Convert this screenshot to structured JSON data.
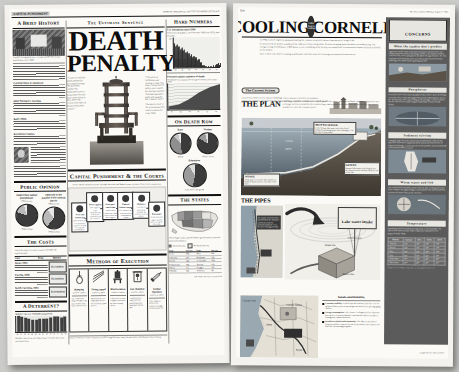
{
  "meta": {
    "background_color": "#cbcbc9",
    "page_color": "#fbfaf7",
    "ink_color": "#111111",
    "accent_dark": "#5b5b5b"
  },
  "left_page": {
    "flag": "CAPITAL PUNISHMENT",
    "dateline": "SUNDAY, JANUARY 20, 1991  THE EXAMINER  SECTION  B",
    "kicker": "The Ultimate Sentence",
    "masthead_line1": "DEATH",
    "masthead_line2": "PENALTY",
    "pull_quote_left": "“I want to stand for death penalty for first-degree murder. We have been conducting experiments over a long, long time and have never failed in fact, deterring victims any rights of prosecuting under statute.”",
    "pull_quote_right": "“The spirit of retribution and revenge is what I do long criminal justice policy, not it stands for proving solutions. The death penalty is politically popular, but it doesn’t work.”",
    "chair_caption": "The electric chair at the state penitentiary, used in executions since 1924.",
    "columns": {
      "left": {
        "section_title": "A Brief History",
        "photo_caption": "A public hanging draws a crowd outside the county courthouse, circa 1885.",
        "subheads": [
          "Colonial times to statehood",
          "After Furman v. Georgia",
          "Early 1980s",
          "Executions resume"
        ]
      },
      "public_opinion": {
        "section_title": "Public Opinion",
        "charts": [
          {
            "title": "Supporting capital punishment",
            "subtitle": "1994 survey",
            "slices": [
              {
                "label": "Favor",
                "value": 80
              },
              {
                "label": "Oppose",
                "value": 16
              },
              {
                "label": "No opinion",
                "value": 4
              }
            ],
            "source": "1994 Gallup"
          },
          {
            "title": "Opposed to the penalty if life without parole",
            "subtitle": "1994 survey",
            "slices": [
              {
                "label": "Favor",
                "value": 61
              },
              {
                "label": "Oppose",
                "value": 29
              },
              {
                "label": "No opinion",
                "value": 10
              }
            ],
            "source": "1994 Gallup"
          }
        ]
      },
      "costs": {
        "section_title": "The Costs",
        "intro": "The price tag of a capital case far exceeds life imprisonment.",
        "table_headers": [
          "Case",
          "Trial",
          "Appeals",
          "Execution"
        ],
        "rows": [
          {
            "label": "Texas, 1992",
            "text": "Average cost of a capital trial and appeals, about triple the cost of life imprisonment.",
            "value": "$2.3 million"
          },
          {
            "label": "Florida, 1988",
            "text": "State costs for each execution, compared with the cost of life in prison.",
            "value": "$3.2 million"
          },
          {
            "label": "North Carolina, 1993",
            "text": "Extra cost per death penalty case over non-capital murder case.",
            "value": "$2.16 million"
          }
        ]
      },
      "deterrent": {
        "section_title": "A Deterrent?",
        "chart": {
          "type": "bar",
          "title": "Murder rate per 100,000 population",
          "categories": [
            "80",
            "81",
            "82",
            "83",
            "84",
            "85",
            "86",
            "87",
            "88",
            "89",
            "90",
            "91",
            "92",
            "93"
          ],
          "values": [
            10.2,
            9.8,
            9.1,
            8.3,
            7.9,
            7.9,
            8.6,
            8.3,
            8.4,
            8.7,
            9.4,
            9.8,
            9.3,
            9.5
          ],
          "ylabel": "Rate",
          "note": "Murder rates have not fallen faster in states that carry out executions."
        }
      }
    },
    "courts": {
      "section_title": "Capital Punishment & the Courts",
      "intro": "How a death sentence moves through the state and federal court systems, from trial to execution.",
      "steps": [
        {
          "n": "1",
          "label": "Trial and sentencing",
          "text": "Jury convicts and recommends a sentence of death in a separate penalty phase."
        },
        {
          "n": "2",
          "label": "Direct appeal",
          "text": "State supreme court automatically reviews the conviction and the sentence."
        },
        {
          "n": "3",
          "label": "State post-conviction",
          "text": "Inmate raises claims that could not be raised on direct appeal."
        },
        {
          "n": "4",
          "label": "Federal habeas corpus",
          "text": "U.S. district court reviews federal constitutional claims."
        },
        {
          "n": "5",
          "label": "Clemency",
          "text": "Governor or board may commute the sentence to life in prison."
        },
        {
          "n": "6",
          "label": "Execution",
          "text": "Death warrant is signed and the date is set by the trial court."
        }
      ]
    },
    "methods": {
      "section_title": "Methods of Execution",
      "items": [
        {
          "name": "Hanging",
          "icon": "noose-icon",
          "states": "Used in 3 states",
          "text": "The condemned drops through a trap door; death results from a broken neck."
        },
        {
          "name": "Firing squad",
          "icon": "rifles-icon",
          "states": "Used in 2 states",
          "text": "Marksmen fire at a target pinned over the heart from about 20 feet."
        },
        {
          "name": "Electrocution",
          "icon": "electric-chair-icon",
          "states": "Used in 11 states",
          "text": "A jolt of 2,000 volts is applied, followed by lower-voltage cycles."
        },
        {
          "name": "Gas chamber",
          "icon": "gas-chamber-icon",
          "states": "Used in 5 states",
          "text": "Cyanide pellets drop into acid, producing lethal hydrogen cyanide gas."
        },
        {
          "name": "Lethal injection",
          "icon": "syringe-icon",
          "states": "Used in 27 states",
          "text": "Three drugs are delivered in sequence through an intravenous line."
        }
      ]
    },
    "right_column": {
      "hard_numbers": {
        "section_title": "Hard Numbers",
        "chart1": {
          "type": "bar",
          "title": "U.S. executions since 1930",
          "subtitle": "Executions dropped to zero between 1968 and 1976, then resumed.",
          "x": [
            1930,
            1940,
            1950,
            1960,
            1970,
            1980,
            1990
          ],
          "values": [
            155,
            124,
            82,
            56,
            0,
            0,
            23
          ],
          "ylabel": "Executions",
          "ylim": [
            0,
            200
          ]
        },
        "chart2": {
          "type": "area",
          "title": "Prisoners under sentence of death",
          "subtitle": "The death-row population has grown every year since 1976.",
          "x": [
            1976,
            1980,
            1984,
            1988,
            1992,
            1994
          ],
          "values": [
            420,
            691,
            1420,
            2124,
            2575,
            2890
          ],
          "ylabel": "Inmates",
          "ylim": [
            0,
            3000
          ]
        }
      },
      "death_row": {
        "section_title": "On Death Row",
        "charts": [
          {
            "title": "Race",
            "slices": [
              {
                "label": "White",
                "value": 48
              },
              {
                "label": "Black",
                "value": 40
              },
              {
                "label": "Hispanic",
                "value": 8
              },
              {
                "label": "Other",
                "value": 4
              }
            ]
          },
          {
            "title": "Victims",
            "slices": [
              {
                "label": "White victim",
                "value": 83
              },
              {
                "label": "Black victim",
                "value": 13
              },
              {
                "label": "Other",
                "value": 4
              }
            ]
          },
          {
            "title": "Education",
            "slices": [
              {
                "label": "Less than 12th grade",
                "value": 53
              },
              {
                "label": "High school graduate",
                "value": 38
              },
              {
                "label": "Some college",
                "value": 9
              }
            ]
          }
        ]
      },
      "states": {
        "section_title": "The States",
        "map_caption": "Thirty-eight states and the federal government authorize capital punishment.",
        "legend": [
          "Death penalty",
          "No death penalty"
        ],
        "table_headers": [
          "State",
          "On row",
          "State",
          "On row"
        ],
        "rows": [
          [
            "Texas",
            "394",
            "Ohio",
            "141"
          ],
          [
            "California",
            "381",
            "Oklahoma",
            "129"
          ],
          [
            "Florida",
            "342",
            "N. Carolina",
            "104"
          ],
          [
            "Pennsylvania",
            "184",
            "Arizona",
            "119"
          ],
          [
            "Illinois",
            "155",
            "Georgia",
            "101"
          ],
          [
            "Alabama",
            "143",
            "Tennessee",
            "99"
          ]
        ]
      }
    },
    "footer": "Sources: Bureau of Justice Statistics; NAACP Legal Defense Fund; Death Penalty Information Center; Gallup",
    "credit": "GRAPHIC BY THE EXAMINER"
  },
  "right_page": {
    "folio": "12A",
    "dateline": "The Ithaca Journal  Monday, August 7, 1995",
    "title_left": "COOLING",
    "title_right": "CORNELL",
    "seal_text": "Lake Source Cooling",
    "intro_paragraphs": [
      "In 1994, Cornell engineers proposed cooling the campus using water drawn from deep in Cayuga Lake.",
      "If constructed, the project would pull the cold water from along about 10 miles of piping from lakeshore air conditioning. The energy savings would power 1,000 homes a year, according to the heavily reviewed Draft Environmental Impact Statement (DEIS) on the project.",
      "Here is how Lake Source Cooling would work, and what some of its lasting environmental concerns are."
    ],
    "current_system": {
      "title": "The Current System",
      "text": "Cornell has chillers in six separate buildings. They consume electricity to compress refrigerant, which is pumped through campus buildings and then returned to be cooled again."
    },
    "plan": {
      "title": "THE PLAN",
      "text": "Cold water would be withdrawn at a depth of 250 feet about two miles offshore, piped to a shoreline heat-exchange facility, warmed by the campus loop, and returned to the lake near the surface. No lake water would ever enter the campus system.",
      "callouts": [
        {
          "n": "1",
          "label": "INTAKE",
          "text": "Intake pipe rests on the lake bottom at a depth of about 250 feet, two miles from shore."
        },
        {
          "n": "2",
          "label": "HEAT EXCHANGE",
          "text": "At the facility, lake water cools the closed campus loop through plate heat exchangers. The two waters never mix."
        },
        {
          "n": "3",
          "label": "RETURN",
          "text": "Warmed lake water is discharged near the shoreline in the shallow southern end of the lake."
        }
      ],
      "depth_labels": [
        "250 ft.",
        "2 miles",
        "Surface",
        "Lake bottom"
      ]
    },
    "pipes": {
      "title": "THE PIPES",
      "intake_label": "Lake water intake",
      "map_note": "The intake and return lines would follow the lakeshore and run beneath the railroad and Route 13 to the heat exchange facility.",
      "labels": [
        "Intake line",
        "Return line",
        "Heat exchange facility",
        "Campus loop"
      ]
    },
    "goals": {
      "title": "Goals and benefits",
      "bullets": [
        {
          "lead": "Economic stability:",
          "text": "Cornell says the system would save several million dollars a year in operating costs and avoid replacing aging chillers."
        },
        {
          "lead": "Energy consumption:",
          "text": "Lake Source Cooling would use about 80 percent less electricity than the conventional chillers it replaces, cutting power plant emissions."
        },
        {
          "lead": "Benefits to schools and community:",
          "text": "The Ithaca City School District would be connected to the loop, and the university would fund lake-monitoring programs."
        }
      ]
    },
    "map_labels": [
      "Cayuga Lake",
      "Ithaca",
      "Cornell campus",
      "Route 13",
      "Heat exchange facility"
    ],
    "concerns": {
      "header": "concerns",
      "sections": [
        {
          "bar": "What the studies don't predict",
          "text": "Opponents say the Draft Environmental Impact Statement does not adequately predict what the discharge will do to the shallow southern end of the lake, where phosphorus already feeds algae blooms. The state Department of Environmental Conservation asked Cornell for more modeling of the plume before granting a permit."
        },
        {
          "bar": "Phosphorus",
          "text": "Deep lake water carries more phosphorus than surface water. Returning it near the shore could add roughly 900 pounds of phosphorus a year to the shallow end, critics say, feeding weeds and algae. Cornell counters that the added load is small compared with what streams already deliver."
        },
        {
          "bar": "Sediment stirring",
          "text": "Laying the pipe across the lake bottom would disturb sediments that may hold chlorinated compounds and heavy metals from decades of industrial discharge. Cornell says the trench would be narrow and would refill naturally within a season."
        },
        {
          "bar": "Warm water and fish",
          "text": "The returned water would be warmer than the lake in spring and cooler in late summer. Biologists disagree about whether that shift would help or harm cold-water fish near the shoreline."
        },
        {
          "bar": "Temperature",
          "text": "Monitoring stations would track temperature at several depths. The table below shows measured lake temperatures by month at the proposed intake depth."
        }
      ],
      "table_headers": [
        "Month",
        "Surface",
        "50 ft.",
        "150 ft.",
        "250 ft."
      ],
      "table_rows": [
        [
          "January",
          "36°",
          "38°",
          "39°",
          "39°"
        ],
        [
          "March",
          "38°",
          "38°",
          "39°",
          "39°"
        ],
        [
          "May",
          "52°",
          "45°",
          "40°",
          "39°"
        ],
        [
          "July",
          "72°",
          "58°",
          "42°",
          "39°"
        ],
        [
          "September",
          "70°",
          "62°",
          "44°",
          "40°"
        ],
        [
          "November",
          "50°",
          "49°",
          "45°",
          "41°"
        ]
      ],
      "caption": "Temperatures in degrees Fahrenheit at the proposed intake site."
    },
    "credit": "Graphic by The Ithaca Journal"
  }
}
